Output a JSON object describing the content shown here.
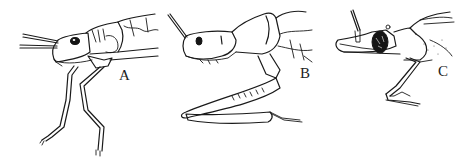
{
  "figure": {
    "background": "#ffffff",
    "ink_color": "#1a1a1a",
    "panels": [
      {
        "id": "A",
        "label": "A"
      },
      {
        "id": "B",
        "label": "B"
      },
      {
        "id": "C",
        "label": "C"
      }
    ]
  }
}
